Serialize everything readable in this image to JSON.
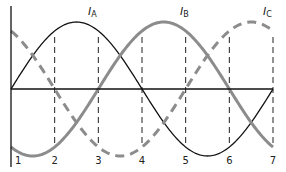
{
  "chart_data": {
    "type": "line",
    "title": "",
    "xlabel": "",
    "ylabel": "",
    "x_ticks": [
      "1",
      "2",
      "3",
      "4",
      "5",
      "6",
      "7"
    ],
    "xlim": [
      1,
      7
    ],
    "ylim": [
      -1,
      1
    ],
    "grid": "dashed vertical lines at x=2..7",
    "series": [
      {
        "name": "IA",
        "label_main": "I",
        "label_sub": "A",
        "style": "solid",
        "color": "#111111",
        "phase_shift_units": 0,
        "formula": "sin(2π(t-1)/6)"
      },
      {
        "name": "IB",
        "label_main": "I",
        "label_sub": "B",
        "style": "solid-thick",
        "color": "#8a8a8a",
        "phase_shift_units": 2,
        "formula": "sin(2π(t-3)/6)"
      },
      {
        "name": "IC",
        "label_main": "I",
        "label_sub": "C",
        "style": "dashed-thick",
        "color": "#8a8a8a",
        "phase_shift_units": 4,
        "formula": "sin(2π(t-5)/6)"
      }
    ]
  },
  "colors": {
    "axis": "#111111",
    "ia": "#111111",
    "ib": "#8c8c8c",
    "ic": "#8c8c8c",
    "grid": "#222222"
  }
}
